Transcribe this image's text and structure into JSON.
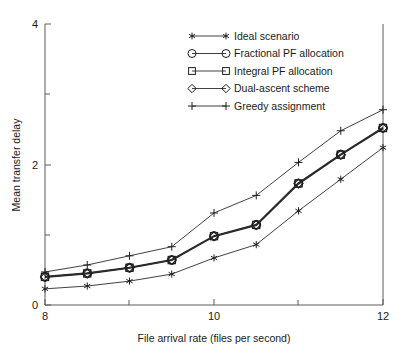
{
  "chart_data": {
    "type": "line",
    "title": "",
    "xlabel": "File arrival rate (files per second)",
    "ylabel": "Mean transfer delay",
    "xlim": [
      8,
      12
    ],
    "ylim": [
      0,
      4
    ],
    "xticks": [
      8,
      10,
      12
    ],
    "xticklabels": [
      "8",
      "10",
      "12"
    ],
    "xminorticks": [
      9,
      11
    ],
    "yticks": [
      0,
      2,
      4
    ],
    "yticklabels": [
      "0",
      "2",
      "4"
    ],
    "yminorticks": [
      1,
      3
    ],
    "grid": false,
    "legend_position": "upper center",
    "x": [
      8,
      8.5,
      9,
      9.5,
      10,
      10.5,
      11,
      11.5,
      12
    ],
    "series": [
      {
        "name": "Ideal scenario",
        "marker": "asterisk",
        "values": [
          0.23,
          0.27,
          0.34,
          0.44,
          0.67,
          0.86,
          1.34,
          1.79,
          2.24
        ]
      },
      {
        "name": "Fractional PF allocation",
        "marker": "circle",
        "values": [
          0.4,
          0.45,
          0.53,
          0.64,
          0.98,
          1.14,
          1.73,
          2.14,
          2.52
        ]
      },
      {
        "name": "Integral PF allocation",
        "marker": "square",
        "values": [
          0.4,
          0.45,
          0.53,
          0.64,
          0.98,
          1.14,
          1.73,
          2.14,
          2.52
        ]
      },
      {
        "name": "Dual-ascent scheme",
        "marker": "diamond",
        "values": [
          0.4,
          0.45,
          0.53,
          0.64,
          0.98,
          1.14,
          1.73,
          2.14,
          2.52
        ]
      },
      {
        "name": "Greedy assignment",
        "marker": "plus",
        "values": [
          0.47,
          0.57,
          0.7,
          0.83,
          1.31,
          1.56,
          2.03,
          2.48,
          2.78
        ]
      }
    ]
  },
  "legend": {
    "entries": [
      {
        "label": "Ideal scenario",
        "marker": "asterisk"
      },
      {
        "label": "Fractional PF allocation",
        "marker": "circle"
      },
      {
        "label": "Integral PF allocation",
        "marker": "square"
      },
      {
        "label": "Dual-ascent scheme",
        "marker": "diamond"
      },
      {
        "label": "Greedy assignment",
        "marker": "plus"
      }
    ]
  },
  "colors": {
    "line": "#2b2b2b",
    "axis": "#5a5a5a",
    "text": "#1a1a1a",
    "background": "#ffffff"
  }
}
